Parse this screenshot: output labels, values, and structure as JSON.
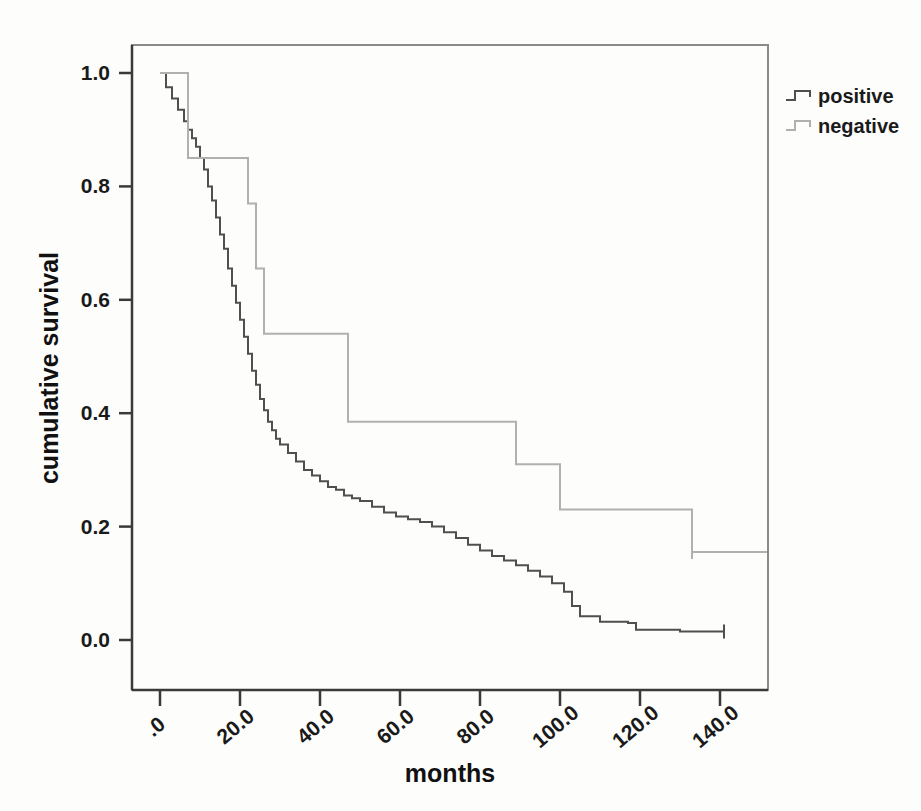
{
  "chart_data": {
    "type": "line",
    "subtype": "kaplan-meier-step",
    "title": "",
    "xlabel": "months",
    "ylabel": "cumulative survival",
    "xlim": [
      -6,
      160
    ],
    "ylim": [
      0.0,
      1.05
    ],
    "grid": false,
    "legend_position": "top-right-outside",
    "x_ticks": [
      0,
      20,
      40,
      60,
      80,
      100,
      120,
      140
    ],
    "x_tick_labels": [
      ".0",
      "20.0",
      "40.0",
      "60.0",
      "80.0",
      "100.0",
      "120.0",
      "140.0"
    ],
    "x_tick_rotation": -40,
    "y_ticks": [
      0.0,
      0.2,
      0.4,
      0.6,
      0.8,
      1.0
    ],
    "y_tick_labels": [
      "0.0",
      "0.2",
      "0.4",
      "0.6",
      "0.8",
      "1.0"
    ],
    "series": [
      {
        "name": "positive",
        "color": "#4f4f4f",
        "x": [
          0,
          1.5,
          3,
          4.5,
          6,
          7,
          8,
          9,
          10,
          11,
          12,
          13,
          14,
          15,
          16,
          17,
          18,
          19,
          20,
          21,
          22,
          23,
          24,
          25,
          26,
          27,
          28,
          29,
          30,
          32,
          34,
          36,
          38,
          40,
          42,
          44,
          46,
          48,
          50,
          53,
          56,
          59,
          62,
          65,
          68,
          71,
          74,
          77,
          80,
          83,
          86,
          89,
          92,
          95,
          98,
          101,
          103,
          105,
          110,
          117,
          119,
          130,
          141
        ],
        "y": [
          1.0,
          0.975,
          0.955,
          0.935,
          0.915,
          0.9,
          0.885,
          0.87,
          0.85,
          0.83,
          0.8,
          0.775,
          0.745,
          0.715,
          0.69,
          0.655,
          0.625,
          0.595,
          0.565,
          0.535,
          0.505,
          0.475,
          0.45,
          0.425,
          0.405,
          0.385,
          0.37,
          0.355,
          0.345,
          0.33,
          0.315,
          0.3,
          0.29,
          0.28,
          0.27,
          0.265,
          0.255,
          0.25,
          0.245,
          0.235,
          0.225,
          0.218,
          0.213,
          0.208,
          0.2,
          0.19,
          0.18,
          0.168,
          0.158,
          0.148,
          0.14,
          0.132,
          0.122,
          0.112,
          0.1,
          0.085,
          0.06,
          0.042,
          0.032,
          0.03,
          0.018,
          0.015,
          0.015
        ]
      },
      {
        "name": "negative",
        "color": "#b0b0b0",
        "x": [
          0,
          6,
          7,
          20,
          22,
          24,
          26,
          42,
          47,
          78,
          89,
          100,
          133,
          156
        ],
        "y": [
          1.0,
          1.0,
          0.85,
          0.85,
          0.77,
          0.655,
          0.54,
          0.54,
          0.385,
          0.385,
          0.31,
          0.23,
          0.155,
          0.08
        ]
      }
    ],
    "terminal_marks": [
      {
        "series": "positive",
        "x": 141,
        "y": 0.015
      },
      {
        "series": "negative",
        "x": 133,
        "y": 0.155
      }
    ]
  },
  "legend": {
    "items": [
      {
        "label": "positive",
        "color": "#4f4f4f"
      },
      {
        "label": "negative",
        "color": "#b0b0b0"
      }
    ]
  },
  "axes": {
    "x_title": "months",
    "y_title": "cumulative survival"
  },
  "colors": {
    "background": "#fdfdfc",
    "frame": "#8a8a8a",
    "axis": "#3a3a3a",
    "positive": "#4f4f4f",
    "negative": "#b0b0b0"
  }
}
